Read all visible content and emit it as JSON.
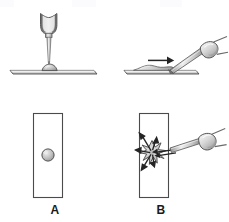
{
  "figure": {
    "background_color": "#ffffff",
    "width": 229,
    "height": 222,
    "panels": [
      {
        "id": "A",
        "label": "A",
        "caption": "Drop of blood placed on slide with dropper",
        "views": [
          "side",
          "top"
        ]
      },
      {
        "id": "B",
        "label": "B",
        "caption": "Spreader slide drawn across drop to make smear",
        "views": [
          "side",
          "top"
        ]
      }
    ]
  },
  "colors": {
    "outline": "#3a3a3a",
    "outline_light": "#6f6f6f",
    "slide_fill": "#ffffff",
    "slide_edge": "#5a5a5a",
    "drop_fill": "#b8b8b8",
    "drop_edge": "#585858",
    "metal_light": "#f2f2f2",
    "metal_mid": "#c9c9c9",
    "metal_dark": "#8a8a8a",
    "arrow": "#2b2b2b",
    "label_text": "#1a1a1a"
  },
  "elements": {
    "dropper": {
      "name": "dropper",
      "description": "vertical dropper with bulb and tapered tip"
    },
    "slide_side_a": {
      "name": "microscope-slide-side-view",
      "description": "thin horizontal slide bar"
    },
    "blood_drop_side_a": {
      "name": "blood-drop",
      "description": "small dome of blood on slide surface"
    },
    "slide_top_a": {
      "name": "microscope-slide-top-view",
      "description": "tall rectangle, top view of slide"
    },
    "blood_drop_top_a": {
      "name": "blood-drop-circle",
      "description": "round drop seen from above"
    },
    "spreader": {
      "name": "spreader-slide",
      "description": "angled spreader slide with handle"
    },
    "slide_side_b": {
      "name": "microscope-slide-side-view",
      "description": "thin horizontal slide bar with smear"
    },
    "smear_side_b": {
      "name": "blood-smear",
      "description": "blood drawn out into a thin film"
    },
    "direction_arrow_side_b": {
      "name": "direction-arrow",
      "description": "arrow showing push direction of spreader"
    },
    "slide_top_b": {
      "name": "microscope-slide-top-view",
      "description": "tall rectangle, top view of slide"
    },
    "splat_top_b": {
      "name": "blood-splat-star",
      "description": "star shaped spreading blood with radiating arrows"
    },
    "spread_arrows_top_b": {
      "name": "spread-direction-arrows",
      "description": "arrows radiating outward from contact point"
    }
  },
  "labels": {
    "panel_a": "A",
    "panel_b": "B"
  }
}
